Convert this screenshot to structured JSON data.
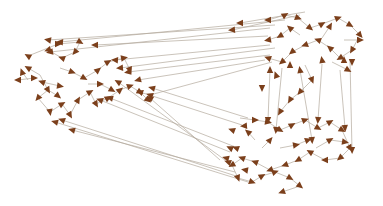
{
  "diagram": {
    "type": "directed-network-graph",
    "colors": {
      "background": "#ffffff",
      "edge": "#b3a99c",
      "arrowhead": "#7b3f1b"
    },
    "edges": [
      [
        305,
        12,
        240,
        23
      ],
      [
        300,
        15,
        232,
        30
      ],
      [
        285,
        20,
        60,
        42
      ],
      [
        275,
        25,
        48,
        40
      ],
      [
        270,
        28,
        50,
        52
      ],
      [
        268,
        36,
        95,
        45
      ],
      [
        270,
        45,
        115,
        60
      ],
      [
        275,
        48,
        120,
        68
      ],
      [
        270,
        55,
        128,
        72
      ],
      [
        265,
        60,
        138,
        80
      ],
      [
        272,
        62,
        150,
        95
      ],
      [
        248,
        118,
        152,
        88
      ],
      [
        242,
        125,
        140,
        92
      ],
      [
        238,
        148,
        110,
        98
      ],
      [
        230,
        152,
        100,
        100
      ],
      [
        225,
        160,
        118,
        82
      ],
      [
        235,
        172,
        72,
        130
      ],
      [
        236,
        176,
        62,
        120
      ],
      [
        220,
        160,
        150,
        98
      ],
      [
        248,
        182,
        55,
        122
      ],
      [
        28,
        56,
        58,
        44
      ],
      [
        58,
        44,
        80,
        42
      ],
      [
        80,
        42,
        75,
        52
      ],
      [
        75,
        52,
        62,
        58
      ],
      [
        62,
        58,
        48,
        50
      ],
      [
        40,
        75,
        28,
        68
      ],
      [
        40,
        75,
        48,
        90
      ],
      [
        48,
        90,
        38,
        98
      ],
      [
        38,
        98,
        50,
        112
      ],
      [
        50,
        112,
        62,
        104
      ],
      [
        62,
        104,
        70,
        115
      ],
      [
        70,
        115,
        78,
        100
      ],
      [
        78,
        100,
        90,
        92
      ],
      [
        90,
        92,
        96,
        104
      ],
      [
        96,
        104,
        108,
        98
      ],
      [
        108,
        98,
        120,
        90
      ],
      [
        120,
        90,
        130,
        86
      ],
      [
        130,
        86,
        140,
        92
      ],
      [
        140,
        92,
        148,
        100
      ],
      [
        60,
        68,
        72,
        72
      ],
      [
        72,
        72,
        84,
        78
      ],
      [
        84,
        78,
        98,
        70
      ],
      [
        98,
        70,
        108,
        62
      ],
      [
        108,
        62,
        124,
        58
      ],
      [
        124,
        58,
        130,
        70
      ],
      [
        42,
        82,
        60,
        86
      ],
      [
        22,
        72,
        28,
        80
      ],
      [
        18,
        80,
        34,
        78
      ],
      [
        48,
        90,
        58,
        96
      ],
      [
        88,
        84,
        100,
        84
      ],
      [
        100,
        84,
        112,
        90
      ],
      [
        268,
        20,
        285,
        15
      ],
      [
        285,
        15,
        298,
        18
      ],
      [
        298,
        18,
        310,
        28
      ],
      [
        310,
        28,
        322,
        24
      ],
      [
        322,
        24,
        338,
        18
      ],
      [
        338,
        18,
        350,
        25
      ],
      [
        350,
        25,
        360,
        35
      ],
      [
        360,
        35,
        352,
        50
      ],
      [
        352,
        50,
        340,
        58
      ],
      [
        340,
        58,
        330,
        48
      ],
      [
        330,
        48,
        318,
        40
      ],
      [
        318,
        40,
        305,
        45
      ],
      [
        305,
        45,
        292,
        52
      ],
      [
        292,
        52,
        282,
        62
      ],
      [
        282,
        62,
        268,
        58
      ],
      [
        300,
        35,
        290,
        28
      ],
      [
        290,
        28,
        280,
        36
      ],
      [
        280,
        36,
        268,
        40
      ],
      [
        322,
        38,
        330,
        26
      ],
      [
        344,
        40,
        360,
        40
      ],
      [
        332,
        62,
        348,
        70
      ],
      [
        305,
        65,
        312,
        80
      ],
      [
        312,
        80,
        300,
        92
      ],
      [
        300,
        92,
        290,
        100
      ],
      [
        290,
        100,
        280,
        112
      ],
      [
        270,
        70,
        268,
        120
      ],
      [
        282,
        68,
        276,
        130
      ],
      [
        300,
        70,
        312,
        140
      ],
      [
        322,
        64,
        318,
        120
      ],
      [
        340,
        70,
        345,
        128
      ],
      [
        350,
        60,
        352,
        150
      ],
      [
        240,
        118,
        255,
        120
      ],
      [
        255,
        120,
        268,
        122
      ],
      [
        268,
        122,
        280,
        130
      ],
      [
        280,
        130,
        292,
        125
      ],
      [
        292,
        125,
        305,
        120
      ],
      [
        305,
        120,
        318,
        128
      ],
      [
        318,
        128,
        330,
        122
      ],
      [
        330,
        122,
        342,
        130
      ],
      [
        342,
        130,
        350,
        148
      ],
      [
        350,
        148,
        340,
        158
      ],
      [
        340,
        158,
        325,
        160
      ],
      [
        325,
        160,
        310,
        152
      ],
      [
        310,
        152,
        298,
        160
      ],
      [
        298,
        160,
        285,
        165
      ],
      [
        285,
        165,
        270,
        170
      ],
      [
        270,
        170,
        255,
        162
      ],
      [
        255,
        162,
        242,
        158
      ],
      [
        242,
        158,
        232,
        165
      ],
      [
        232,
        165,
        238,
        178
      ],
      [
        238,
        178,
        252,
        182
      ],
      [
        252,
        182,
        262,
        176
      ],
      [
        262,
        176,
        275,
        172
      ],
      [
        275,
        172,
        290,
        178
      ],
      [
        290,
        178,
        300,
        186
      ],
      [
        300,
        186,
        282,
        192
      ],
      [
        255,
        140,
        248,
        132
      ],
      [
        262,
        148,
        270,
        140
      ],
      [
        280,
        148,
        296,
        145
      ],
      [
        296,
        145,
        308,
        140
      ],
      [
        316,
        148,
        330,
        140
      ],
      [
        330,
        140,
        345,
        142
      ]
    ],
    "arrowheads": [
      [
        240,
        23,
        180
      ],
      [
        232,
        30,
        175
      ],
      [
        60,
        42,
        185
      ],
      [
        48,
        40,
        190
      ],
      [
        50,
        52,
        170
      ],
      [
        95,
        45,
        180
      ],
      [
        115,
        60,
        185
      ],
      [
        120,
        68,
        175
      ],
      [
        128,
        72,
        170
      ],
      [
        138,
        80,
        165
      ],
      [
        150,
        95,
        200
      ],
      [
        152,
        88,
        195
      ],
      [
        140,
        92,
        200
      ],
      [
        110,
        98,
        195
      ],
      [
        100,
        100,
        200
      ],
      [
        118,
        82,
        210
      ],
      [
        72,
        130,
        195
      ],
      [
        62,
        120,
        200
      ],
      [
        150,
        98,
        210
      ],
      [
        55,
        122,
        195
      ],
      [
        28,
        56,
        210
      ],
      [
        58,
        44,
        0
      ],
      [
        80,
        42,
        30
      ],
      [
        75,
        52,
        130
      ],
      [
        62,
        58,
        200
      ],
      [
        48,
        50,
        160
      ],
      [
        28,
        68,
        210
      ],
      [
        48,
        90,
        60
      ],
      [
        38,
        98,
        130
      ],
      [
        50,
        112,
        80
      ],
      [
        62,
        104,
        330
      ],
      [
        70,
        115,
        60
      ],
      [
        78,
        100,
        300
      ],
      [
        90,
        92,
        330
      ],
      [
        96,
        104,
        60
      ],
      [
        108,
        98,
        330
      ],
      [
        120,
        90,
        320
      ],
      [
        130,
        86,
        340
      ],
      [
        140,
        92,
        30
      ],
      [
        148,
        100,
        40
      ],
      [
        72,
        72,
        20
      ],
      [
        84,
        78,
        30
      ],
      [
        98,
        70,
        320
      ],
      [
        108,
        62,
        330
      ],
      [
        124,
        58,
        350
      ],
      [
        130,
        70,
        70
      ],
      [
        60,
        86,
        10
      ],
      [
        22,
        72,
        250
      ],
      [
        34,
        78,
        0
      ],
      [
        58,
        96,
        40
      ],
      [
        100,
        84,
        0
      ],
      [
        112,
        90,
        30
      ],
      [
        18,
        80,
        180
      ],
      [
        42,
        82,
        200
      ],
      [
        268,
        20,
        180
      ],
      [
        285,
        15,
        330
      ],
      [
        298,
        18,
        20
      ],
      [
        310,
        28,
        40
      ],
      [
        322,
        24,
        330
      ],
      [
        338,
        18,
        340
      ],
      [
        350,
        25,
        30
      ],
      [
        360,
        35,
        50
      ],
      [
        352,
        50,
        120
      ],
      [
        340,
        58,
        150
      ],
      [
        330,
        48,
        220
      ],
      [
        318,
        40,
        200
      ],
      [
        305,
        45,
        160
      ],
      [
        292,
        52,
        140
      ],
      [
        282,
        62,
        140
      ],
      [
        268,
        58,
        200
      ],
      [
        290,
        28,
        220
      ],
      [
        280,
        36,
        150
      ],
      [
        268,
        40,
        170
      ],
      [
        330,
        26,
        300
      ],
      [
        360,
        40,
        0
      ],
      [
        348,
        70,
        30
      ],
      [
        312,
        80,
        70
      ],
      [
        300,
        92,
        130
      ],
      [
        290,
        100,
        120
      ],
      [
        280,
        112,
        120
      ],
      [
        268,
        120,
        90
      ],
      [
        276,
        130,
        95
      ],
      [
        312,
        140,
        85
      ],
      [
        318,
        120,
        95
      ],
      [
        345,
        128,
        85
      ],
      [
        352,
        150,
        88
      ],
      [
        255,
        120,
        0
      ],
      [
        268,
        122,
        10
      ],
      [
        280,
        130,
        30
      ],
      [
        292,
        125,
        330
      ],
      [
        305,
        120,
        340
      ],
      [
        318,
        128,
        30
      ],
      [
        330,
        122,
        330
      ],
      [
        342,
        130,
        30
      ],
      [
        350,
        148,
        60
      ],
      [
        340,
        158,
        140
      ],
      [
        325,
        160,
        180
      ],
      [
        310,
        152,
        210
      ],
      [
        298,
        160,
        150
      ],
      [
        285,
        165,
        160
      ],
      [
        270,
        170,
        160
      ],
      [
        255,
        162,
        200
      ],
      [
        242,
        158,
        200
      ],
      [
        232,
        165,
        150
      ],
      [
        238,
        178,
        70
      ],
      [
        252,
        182,
        20
      ],
      [
        262,
        176,
        330
      ],
      [
        275,
        172,
        340
      ],
      [
        290,
        178,
        30
      ],
      [
        300,
        186,
        40
      ],
      [
        282,
        192,
        160
      ],
      [
        248,
        132,
        220
      ],
      [
        270,
        140,
        310
      ],
      [
        296,
        145,
        350
      ],
      [
        308,
        140,
        340
      ],
      [
        330,
        140,
        330
      ],
      [
        345,
        142,
        10
      ],
      [
        262,
        88,
        90
      ],
      [
        290,
        65,
        270
      ],
      [
        322,
        60,
        260
      ],
      [
        344,
        60,
        270
      ],
      [
        300,
        70,
        260
      ],
      [
        270,
        70,
        270
      ],
      [
        276,
        75,
        250
      ],
      [
        352,
        62,
        90
      ],
      [
        232,
        130,
        200
      ],
      [
        226,
        158,
        195
      ],
      [
        236,
        148,
        200
      ],
      [
        245,
        170,
        190
      ],
      [
        244,
        126,
        175
      ],
      [
        230,
        148,
        205
      ],
      [
        228,
        162,
        200
      ]
    ]
  }
}
